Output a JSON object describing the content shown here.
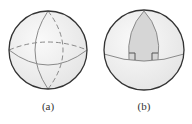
{
  "figures": [
    {
      "id": "a",
      "label": "(a)",
      "description": "Sphere with great circles (equator and meridians); hidden parts dashed"
    },
    {
      "id": "b",
      "label": "(b)",
      "description": "Sphere with shaded spherical triangle from pole to equator with two right angles"
    }
  ],
  "colors": {
    "sphere_fill": "#f2f2f2",
    "outline": "#333333",
    "great_circle": "#8a8a8a",
    "triangle_fill": "#d6d6d6"
  }
}
